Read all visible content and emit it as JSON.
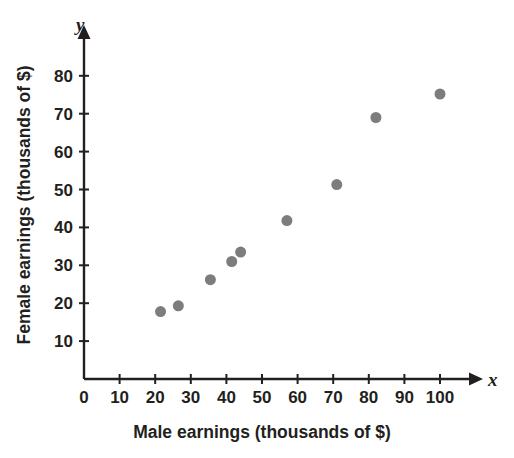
{
  "chart_data": {
    "type": "scatter",
    "title": "",
    "xlabel": "Male earnings (thousands of $)",
    "ylabel": "Female earnings (thousands of $)",
    "x_axis_letter": "x",
    "y_axis_letter": "y",
    "xlim": [
      0,
      108
    ],
    "ylim": [
      0,
      86
    ],
    "xticks": [
      0,
      10,
      20,
      30,
      40,
      50,
      60,
      70,
      80,
      90,
      100
    ],
    "xticklabels": [
      "0",
      "10",
      "20",
      "30",
      "40",
      "50",
      "60",
      "70",
      "80",
      "90",
      "100"
    ],
    "yticks": [
      10,
      20,
      30,
      40,
      50,
      60,
      70,
      80
    ],
    "yticklabels": [
      "10",
      "20",
      "30",
      "40",
      "50",
      "60",
      "70",
      "80"
    ],
    "grid": false,
    "legend": false,
    "marker": "circle",
    "marker_color": "#7d7d7d",
    "marker_size": 11,
    "points": [
      {
        "x": 21.5,
        "y": 17.8
      },
      {
        "x": 26.5,
        "y": 19.3
      },
      {
        "x": 35.5,
        "y": 26.2
      },
      {
        "x": 41.5,
        "y": 31.0
      },
      {
        "x": 44.0,
        "y": 33.5
      },
      {
        "x": 57.0,
        "y": 41.8
      },
      {
        "x": 71.0,
        "y": 51.3
      },
      {
        "x": 82.0,
        "y": 69.0
      },
      {
        "x": 100.0,
        "y": 75.2
      }
    ]
  },
  "colors": {
    "axis": "#231f20",
    "marker": "#7d7d7d",
    "background": "#ffffff"
  }
}
